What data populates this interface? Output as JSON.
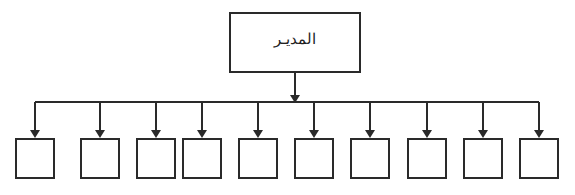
{
  "diagram": {
    "type": "org-chart",
    "root": {
      "label": "المديـر"
    },
    "children": [
      {
        "label": ""
      },
      {
        "label": ""
      },
      {
        "label": ""
      },
      {
        "label": ""
      },
      {
        "label": ""
      },
      {
        "label": ""
      },
      {
        "label": ""
      },
      {
        "label": ""
      },
      {
        "label": ""
      },
      {
        "label": ""
      }
    ],
    "colors": {
      "stroke": "#2a2a2a",
      "background": "#ffffff",
      "text": "#222222"
    }
  }
}
